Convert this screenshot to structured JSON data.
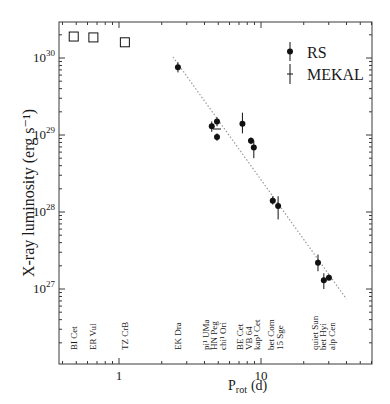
{
  "chart_data": {
    "type": "scatter",
    "title": "",
    "xlabel": "P_rot (d)",
    "xlabel_main": "P",
    "xlabel_sub": "rot",
    "xlabel_unit": "(d)",
    "ylabel": "X-ray luminosity (erg s⁻¹)",
    "xscale": "log",
    "yscale": "log",
    "xlim": [
      0.41,
      39
    ],
    "ylim": [
      3.6e+26,
      2.9e+30
    ],
    "x_ticks": [
      {
        "value": 1,
        "label": "1"
      },
      {
        "value": 10,
        "label": "10"
      }
    ],
    "y_ticks": [
      {
        "value": 1e+27,
        "base": "10",
        "exp": "27"
      },
      {
        "value": 1e+28,
        "base": "10",
        "exp": "28"
      },
      {
        "value": 1e+29,
        "base": "10",
        "exp": "29"
      },
      {
        "value": 1e+30,
        "base": "10",
        "exp": "30"
      }
    ],
    "grid": false,
    "legend": {
      "position": "upper right",
      "entries": [
        {
          "label": "RS",
          "marker": "filled-circle-with-errorbar"
        },
        {
          "label": "MEKAL",
          "marker": "errorbar-only"
        }
      ]
    },
    "series": [
      {
        "name": "RS",
        "marker": "filled-circle",
        "points": [
          {
            "star": "EK Dra",
            "x": 2.6,
            "y": 7.6e+29,
            "yerr": [
              6.5e+29,
              8.8e+29
            ]
          },
          {
            "star": "pi1 UMa",
            "x": 4.5,
            "y": 1.3e+29,
            "yerr": [
              1.1e+29,
              1.5e+29
            ]
          },
          {
            "star": "HN Peg",
            "x": 4.9,
            "y": 9.4e+28,
            "yerr": [
              8.4e+28,
              1.05e+29
            ]
          },
          {
            "star": "chi1 Ori",
            "x": 4.9,
            "y": 1.5e+29,
            "yerr": [
              1.3e+29,
              1.7e+29
            ]
          },
          {
            "star": "BE Cet",
            "x": 7.4,
            "y": 1.4e+29,
            "yerr": [
              1.05e+29,
              1.95e+29
            ]
          },
          {
            "star": "VB 64",
            "x": 8.5,
            "y": 8.4e+28,
            "yerr": [
              7.6e+28,
              9.3e+28
            ]
          },
          {
            "star": "kap1 Cet",
            "x": 8.9,
            "y": 6.9e+28,
            "yerr": [
              5e+28,
              8.5e+28
            ]
          },
          {
            "star": "bet Com",
            "x": 12.1,
            "y": 1.4e+28,
            "yerr": [
              1.25e+28,
              1.6e+28
            ]
          },
          {
            "star": "15 Sge",
            "x": 13.2,
            "y": 1.2e+28,
            "yerr": [
              8e+27,
              1.6e+28
            ]
          },
          {
            "star": "quiet Sun",
            "x": 25.2,
            "y": 2.2e+27,
            "yerr": [
              1.7e+27,
              2.8e+27
            ]
          },
          {
            "star": "bet Hyi",
            "x": 27.7,
            "y": 1.3e+27,
            "yerr": [
              1e+27,
              1.6e+27
            ]
          },
          {
            "star": "alp Cen",
            "x": 30.1,
            "y": 1.4e+27,
            "yerr": [
              1.3e+27,
              1.55e+27
            ]
          }
        ]
      },
      {
        "name": "Upper points (open squares)",
        "marker": "open-square",
        "points": [
          {
            "star": "BI Cet",
            "x": 0.48,
            "y": 1.9e+30
          },
          {
            "star": "ER Vul",
            "x": 0.66,
            "y": 1.85e+30
          },
          {
            "star": "TZ CrB",
            "x": 1.1,
            "y": 1.6e+30
          }
        ]
      },
      {
        "name": "Power-law fit",
        "type": "line",
        "style": "dotted",
        "points": [
          {
            "x": 2.4,
            "y": 1.03e+30
          },
          {
            "x": 40,
            "y": 7.4e+26
          }
        ]
      }
    ],
    "annotations": [
      {
        "x": 0.48,
        "lines": [
          "BI Cet"
        ]
      },
      {
        "x": 0.66,
        "lines": [
          "ER Vul"
        ]
      },
      {
        "x": 1.1,
        "lines": [
          "TZ CrB"
        ]
      },
      {
        "x": 2.6,
        "lines": [
          "EK Dra"
        ]
      },
      {
        "x": 4.7,
        "lines": [
          "pi¹ UMa",
          "HN Peg",
          "chi¹ Ori"
        ]
      },
      {
        "x": 8.2,
        "lines": [
          "BE Cet",
          "VB 64",
          "kap¹ Cet"
        ]
      },
      {
        "x": 12.6,
        "lines": [
          "bet Com",
          "15 Sge"
        ]
      },
      {
        "x": 27.5,
        "lines": [
          "quiet Sun",
          "bet Hyi",
          "alp Cen"
        ]
      }
    ]
  },
  "colors": {
    "axis": "#3a3a3a",
    "marker": "#111111",
    "fit_line": "#9a9a9a",
    "text": "#1a1a1a"
  }
}
